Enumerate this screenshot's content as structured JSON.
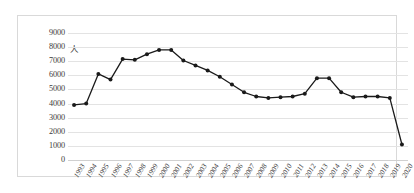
{
  "chart_data": {
    "type": "line",
    "title": "",
    "xlabel": "",
    "ylabel": "人",
    "unit_label": "人",
    "ylim": [
      0,
      9000
    ],
    "ytick_step": 1000,
    "yticks": [
      9000,
      8000,
      7000,
      6000,
      5000,
      4000,
      3000,
      2000,
      1000,
      0
    ],
    "grid": true,
    "legend": "none",
    "marker": "filled-circle",
    "line_color": "#1a1a1a",
    "marker_color": "#1a1a1a",
    "grid_color": "#e3e3e3",
    "categories": [
      "1993",
      "1994",
      "1995",
      "1996",
      "1997",
      "1998",
      "1999",
      "2000",
      "2001",
      "2002",
      "2003",
      "2004",
      "2005",
      "2006",
      "2007",
      "2008",
      "2009",
      "2010",
      "2011",
      "2012",
      "2013",
      "2014",
      "2015",
      "2016",
      "2017",
      "2018",
      "2019",
      "2020"
    ],
    "values": [
      3900,
      4000,
      6100,
      5700,
      7150,
      7100,
      7500,
      7800,
      7800,
      7050,
      6700,
      6350,
      5900,
      5350,
      4800,
      4500,
      4400,
      4450,
      4500,
      4700,
      5800,
      5800,
      4800,
      4450,
      4500,
      4500,
      4400,
      1100
    ]
  }
}
